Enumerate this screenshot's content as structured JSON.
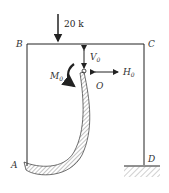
{
  "diagram": {
    "type": "rigid-frame-free-body",
    "load": {
      "label": "20 k",
      "direction": "down"
    },
    "nodes": {
      "B": "B",
      "C": "C",
      "A": "A",
      "D": "D",
      "O": "O"
    },
    "redundants": {
      "V0": {
        "main": "V",
        "sub": "0"
      },
      "H0": {
        "main": "H",
        "sub": "0"
      },
      "M0": {
        "main": "M",
        "sub": "0"
      }
    },
    "colors": {
      "line": "#222222",
      "hatch": "#555555",
      "background": "#ffffff"
    }
  }
}
